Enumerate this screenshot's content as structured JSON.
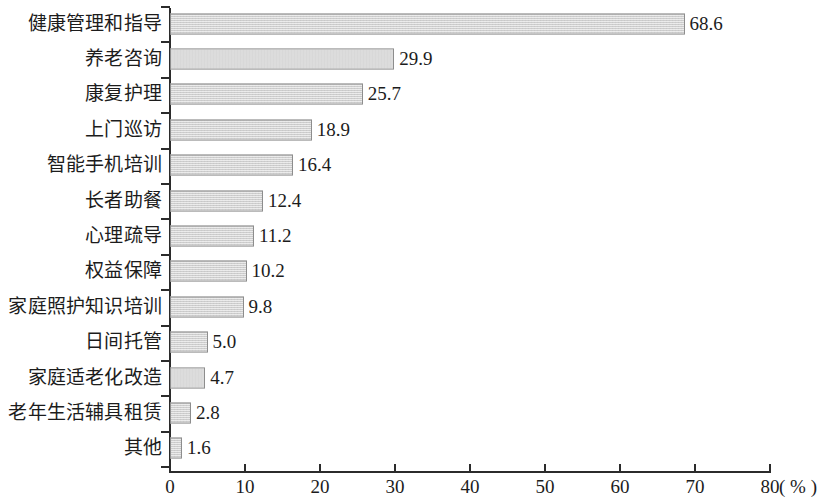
{
  "chart_data": {
    "type": "bar",
    "orientation": "horizontal",
    "title": "",
    "subtitle": "",
    "xlabel": "(%)",
    "ylabel": "",
    "xlim": [
      0,
      80
    ],
    "xticks": [
      0,
      10,
      20,
      30,
      40,
      50,
      60,
      70,
      80
    ],
    "xtick_labels": [
      "0",
      "10",
      "20",
      "30",
      "40",
      "50",
      "60",
      "70",
      "80"
    ],
    "grid": false,
    "legend": null,
    "value_label_format": "one-decimal",
    "categories": [
      "健康管理和指导",
      "养老咨询",
      "康复护理",
      "上门巡访",
      "智能手机培训",
      "长者助餐",
      "心理疏导",
      "权益保障",
      "家庭照护知识培训",
      "日间托管",
      "家庭适老化改造",
      "老年生活辅具租赁",
      "其他"
    ],
    "values": [
      68.6,
      29.9,
      25.7,
      18.9,
      16.4,
      12.4,
      11.2,
      10.2,
      9.8,
      5.0,
      4.7,
      2.8,
      1.6
    ],
    "value_labels": [
      "68.6",
      "29.9",
      "25.7",
      "18.9",
      "16.4",
      "12.4",
      "11.2",
      "10.2",
      "9.8",
      "5.0",
      "4.7",
      "2.8",
      "1.6"
    ],
    "colors": {
      "bar_fill": "#d4d4d4",
      "bar_border": "#8d8d8d",
      "axis": "#2b2b2b",
      "text": "#1c1c1c",
      "background": "#ffffff"
    }
  },
  "axis": {
    "unit_suffix": "( % )"
  }
}
